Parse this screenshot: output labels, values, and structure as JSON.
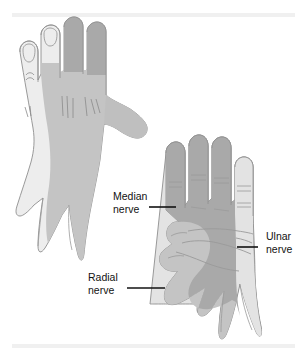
{
  "figure": {
    "background_color": "#ffffff",
    "width": 307,
    "height": 361,
    "views": [
      {
        "name": "dorsal-hand",
        "description": "Back (dorsal) view of left hand, fingers pointing up, thumb to the right"
      },
      {
        "name": "palmar-hand",
        "description": "Palm (palmar) view of right hand, fingers pointing up, thumb to the left"
      }
    ]
  },
  "palette": {
    "median_shade": "#a9a9a9",
    "radial_shade": "#c4c4c4",
    "ulnar_shade": "#e3e3e3",
    "outline": "#8f8f8f",
    "crease": "#9a9a9a",
    "label_text": "#121212",
    "leader_line": "#121212",
    "band": "#f0f0f0",
    "background": "#ffffff"
  },
  "labels": {
    "median": {
      "line1": "Median",
      "line2": "nerve",
      "full": "Median nerve",
      "anchor": "start",
      "x": 113,
      "y1": 200,
      "y2": 213,
      "leader": {
        "x1": 149,
        "y1": 207,
        "x2": 176,
        "y2": 207
      }
    },
    "radial": {
      "line1": "Radial",
      "line2": "nerve",
      "full": "Radial nerve",
      "anchor": "start",
      "x": 88,
      "y1": 281,
      "y2": 294,
      "leader": {
        "x1": 127,
        "y1": 288,
        "x2": 165,
        "y2": 288
      }
    },
    "ulnar": {
      "line1": "Ulnar",
      "line2": "nerve",
      "full": "Ulnar nerve",
      "anchor": "start",
      "x": 266,
      "y1": 240,
      "y2": 253,
      "leader": {
        "x1": 237,
        "y1": 247,
        "x2": 258,
        "y2": 247
      }
    }
  },
  "bands": {
    "top": {
      "y": 13,
      "height": 4
    },
    "bottom": {
      "y": 344,
      "height": 4
    }
  }
}
